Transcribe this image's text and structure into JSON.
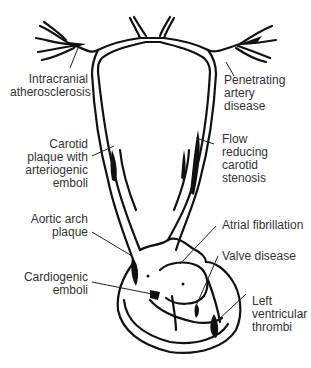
{
  "diagram": {
    "title": "",
    "type": "anatomical-illustration",
    "labels": [
      {
        "id": "intracranial",
        "text": "Intracranial\natherosclerosis",
        "side": "left"
      },
      {
        "id": "carotid_plaque",
        "text": "Carotid\nplaque with\narteriogenic\nemboli",
        "side": "left"
      },
      {
        "id": "aortic_arch",
        "text": "Aortic arch\nplaque",
        "side": "left"
      },
      {
        "id": "cardiogenic",
        "text": "Cardiogenic\nemboli",
        "side": "left"
      },
      {
        "id": "penetrating",
        "text": "Penetrating\nartery\ndisease",
        "side": "right"
      },
      {
        "id": "flow_reducing",
        "text": "Flow\nreducing\ncarotid\nstenosis",
        "side": "right"
      },
      {
        "id": "atrial_fib",
        "text": "Atrial fibrillation",
        "side": "right"
      },
      {
        "id": "valve",
        "text": "Valve disease",
        "side": "right"
      },
      {
        "id": "lv_thrombi",
        "text": "Left\nventricular\nthrombi",
        "side": "right"
      }
    ],
    "colors": {
      "line": "#111111",
      "text": "#333333",
      "background": "#ffffff"
    }
  }
}
